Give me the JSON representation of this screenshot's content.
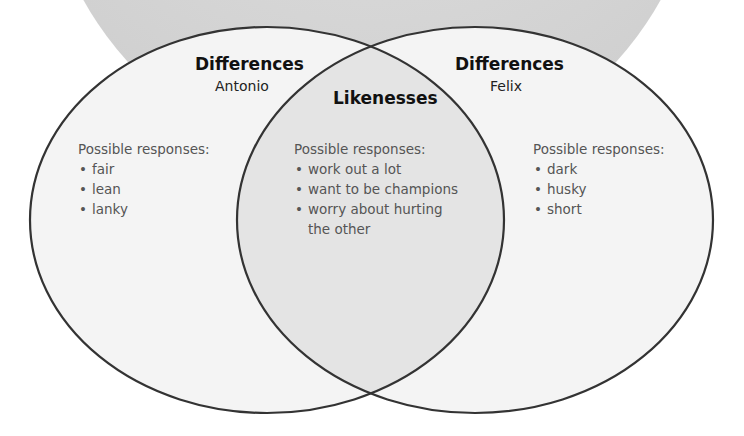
{
  "diagram": {
    "type": "venn",
    "colors": {
      "background_circle": "#d9d9d9",
      "set_fill": "#f3f3f3",
      "overlap_fill": "#e6e6e6",
      "outline": "#333333",
      "response_text": "#555555"
    },
    "left": {
      "title": "Differences",
      "subtitle": "Antonio",
      "responses_heading": "Possible responses:",
      "responses": [
        "fair",
        "lean",
        "lanky"
      ]
    },
    "center": {
      "title": "Likenesses",
      "responses_heading": "Possible responses:",
      "responses": [
        "work out a lot",
        "want to be champions",
        "worry about hurting",
        "the other"
      ]
    },
    "right": {
      "title": "Differences",
      "subtitle": "Felix",
      "responses_heading": "Possible responses:",
      "responses": [
        "dark",
        "husky",
        "short"
      ]
    }
  }
}
